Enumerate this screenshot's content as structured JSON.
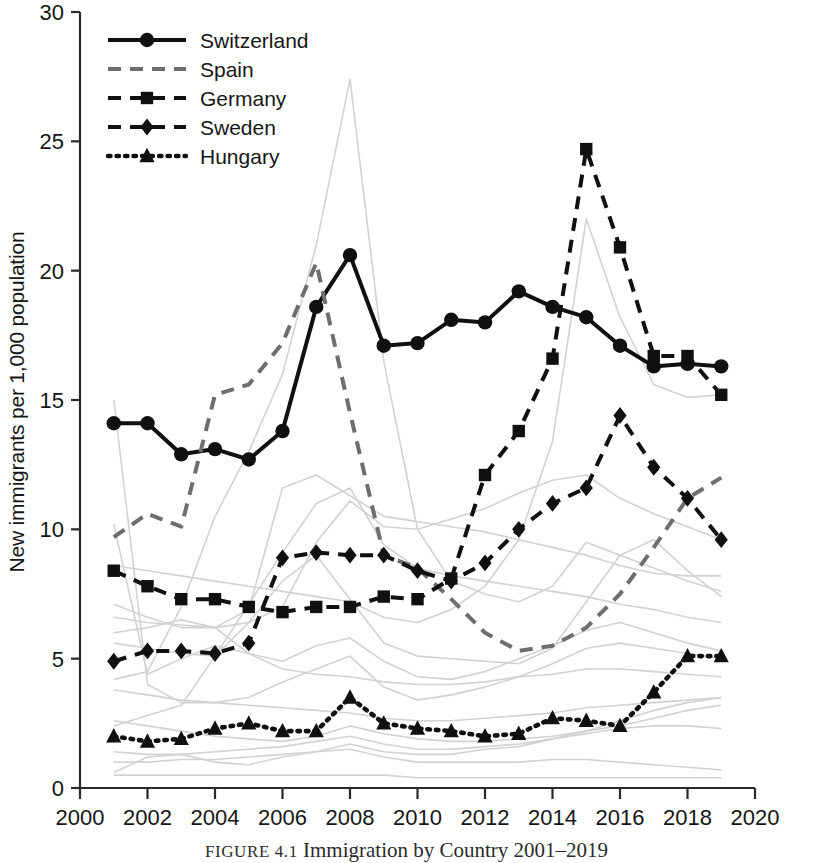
{
  "caption": {
    "figure_label": "FIGURE 4.1",
    "title": "Immigration by Country 2001–2019",
    "full": "FIGURE 4.1  Immigration by Country 2001–2019"
  },
  "chart_data": {
    "type": "line",
    "title": "",
    "xlabel": "",
    "ylabel": "New immigrants per 1,000 population",
    "xlim": [
      2000,
      2020
    ],
    "ylim": [
      0,
      30
    ],
    "xticks": [
      2000,
      2002,
      2004,
      2006,
      2008,
      2010,
      2012,
      2014,
      2016,
      2018,
      2020
    ],
    "yticks": [
      0,
      5,
      10,
      15,
      20,
      25,
      30
    ],
    "xtick_labels": [
      "2000",
      "2002",
      "2004",
      "2006",
      "2008",
      "2010",
      "2012",
      "2014",
      "2016",
      "2018",
      "2020"
    ],
    "ytick_labels": [
      "0",
      "5",
      "10",
      "15",
      "20",
      "25",
      "30"
    ],
    "grid": false,
    "legend_position": "upper-left-inside",
    "x": [
      2001,
      2002,
      2003,
      2004,
      2005,
      2006,
      2007,
      2008,
      2009,
      2010,
      2011,
      2012,
      2013,
      2014,
      2015,
      2016,
      2017,
      2018,
      2019
    ],
    "series": [
      {
        "name": "Switzerland",
        "color": "#101010",
        "line_style": "solid",
        "marker": "circle",
        "values": [
          14.1,
          14.1,
          12.9,
          13.1,
          12.7,
          13.8,
          18.6,
          20.6,
          17.1,
          17.2,
          18.1,
          18.0,
          19.2,
          18.6,
          18.2,
          17.1,
          16.3,
          16.4,
          16.3
        ]
      },
      {
        "name": "Spain",
        "color": "#6e6e6e",
        "line_style": "dashed",
        "marker": "none",
        "values": [
          9.7,
          10.6,
          10.1,
          15.2,
          15.6,
          17.2,
          20.3,
          14.5,
          9.0,
          8.5,
          7.3,
          6.0,
          5.3,
          5.5,
          6.2,
          7.5,
          9.3,
          11.2,
          12.0
        ]
      },
      {
        "name": "Germany",
        "color": "#101010",
        "line_style": "dashed",
        "marker": "square",
        "values": [
          8.4,
          7.8,
          7.3,
          7.3,
          7.0,
          6.8,
          7.0,
          7.0,
          7.4,
          7.3,
          8.1,
          12.1,
          13.8,
          16.6,
          24.7,
          20.9,
          16.7,
          16.7,
          15.2
        ]
      },
      {
        "name": "Sweden",
        "color": "#101010",
        "line_style": "dashed",
        "marker": "diamond",
        "values": [
          4.9,
          5.3,
          5.3,
          5.2,
          5.6,
          8.9,
          9.1,
          9.0,
          9.0,
          8.4,
          8.0,
          8.7,
          10.0,
          11.0,
          11.6,
          14.4,
          12.4,
          11.2,
          9.6
        ]
      },
      {
        "name": "Hungary",
        "color": "#101010",
        "line_style": "dotted",
        "marker": "triangle",
        "values": [
          2.0,
          1.8,
          1.9,
          2.3,
          2.5,
          2.2,
          2.2,
          3.5,
          2.5,
          2.3,
          2.2,
          2.0,
          2.1,
          2.7,
          2.6,
          2.4,
          3.7,
          5.1,
          5.1
        ]
      }
    ],
    "background_series_note": "many light-gray unlabeled country lines",
    "background_series": [
      {
        "name": "bg-1",
        "values": [
          15.0,
          4.0,
          3.3,
          3.3,
          3.5,
          4.1,
          4.6,
          5.1,
          3.9,
          3.4,
          3.6,
          3.9,
          4.3,
          4.8,
          5.4,
          5.6,
          5.4,
          5.2,
          5.0
        ]
      },
      {
        "name": "bg-2",
        "values": [
          0.6,
          1.2,
          1.3,
          1.0,
          0.9,
          1.2,
          1.4,
          1.7,
          1.4,
          1.3,
          1.3,
          1.5,
          1.6,
          1.9,
          2.2,
          2.6,
          3.0,
          3.3,
          3.5
        ]
      },
      {
        "name": "bg-3",
        "values": [
          6.6,
          6.4,
          6.3,
          6.2,
          6.4,
          7.0,
          9.5,
          11.1,
          10.1,
          10.0,
          10.4,
          10.8,
          11.4,
          11.9,
          12.1,
          11.2,
          10.6,
          10.1,
          9.6
        ]
      },
      {
        "name": "bg-4",
        "values": [
          7.1,
          6.6,
          6.2,
          6.2,
          6.9,
          11.6,
          12.1,
          11.3,
          10.5,
          10.3,
          10.1,
          9.9,
          9.6,
          9.3,
          9.0,
          8.6,
          8.3,
          8.2,
          8.2
        ]
      },
      {
        "name": "bg-5",
        "values": [
          2.4,
          2.8,
          3.2,
          5.1,
          7.1,
          9.1,
          11.0,
          11.6,
          9.4,
          8.5,
          8.2,
          8.0,
          7.8,
          7.6,
          7.4,
          7.1,
          6.9,
          6.6,
          6.4
        ]
      },
      {
        "name": "bg-6",
        "values": [
          10.2,
          4.4,
          5.0,
          5.5,
          5.2,
          4.9,
          5.5,
          5.8,
          4.9,
          4.3,
          4.2,
          4.5,
          5.0,
          5.5,
          6.1,
          6.4,
          6.0,
          5.6,
          5.3
        ]
      },
      {
        "name": "bg-7",
        "values": [
          1.0,
          1.0,
          1.1,
          1.1,
          1.2,
          1.3,
          1.4,
          1.5,
          1.2,
          1.0,
          1.0,
          1.0,
          1.0,
          1.1,
          1.1,
          1.0,
          0.9,
          0.8,
          0.7
        ]
      },
      {
        "name": "bg-8",
        "values": [
          4.2,
          4.5,
          7.0,
          10.5,
          13.0,
          16.0,
          21.0,
          27.4,
          16.5,
          10.0,
          8.0,
          7.5,
          7.2,
          7.8,
          9.5,
          9.0,
          8.5,
          8.0,
          7.6
        ]
      },
      {
        "name": "bg-9",
        "values": [
          8.6,
          8.4,
          8.2,
          8.0,
          7.8,
          7.6,
          7.4,
          7.2,
          6.6,
          6.4,
          6.9,
          7.8,
          9.6,
          13.4,
          22.0,
          18.2,
          15.6,
          15.1,
          15.2
        ]
      },
      {
        "name": "bg-10",
        "values": [
          3.8,
          3.6,
          3.4,
          3.3,
          3.2,
          3.1,
          3.0,
          2.9,
          2.7,
          2.6,
          2.6,
          2.7,
          2.8,
          2.9,
          3.1,
          3.2,
          3.3,
          3.4,
          3.5
        ]
      },
      {
        "name": "bg-11",
        "values": [
          0.5,
          0.5,
          0.5,
          0.5,
          0.5,
          0.5,
          0.5,
          0.5,
          0.5,
          0.4,
          0.4,
          0.4,
          0.4,
          0.4,
          0.4,
          0.4,
          0.4,
          0.4,
          0.4
        ]
      },
      {
        "name": "bg-12",
        "values": [
          5.6,
          5.4,
          5.2,
          5.1,
          6.4,
          8.0,
          9.0,
          7.3,
          5.6,
          5.1,
          5.0,
          4.9,
          4.8,
          5.4,
          7.2,
          9.0,
          9.6,
          8.4,
          7.4
        ]
      },
      {
        "name": "bg-13",
        "values": [
          1.4,
          1.3,
          1.3,
          1.4,
          1.5,
          1.6,
          1.8,
          2.0,
          1.7,
          1.5,
          1.5,
          1.6,
          1.7,
          1.9,
          2.1,
          2.3,
          2.4,
          2.4,
          2.3
        ]
      },
      {
        "name": "bg-14",
        "values": [
          6.0,
          6.2,
          6.5,
          6.2,
          5.2,
          4.6,
          4.4,
          4.3,
          4.1,
          4.0,
          4.0,
          4.1,
          4.3,
          4.4,
          4.6,
          4.6,
          4.5,
          4.4,
          4.3
        ]
      },
      {
        "name": "bg-15",
        "values": [
          2.6,
          2.4,
          2.2,
          2.0,
          1.9,
          1.8,
          2.0,
          2.4,
          2.1,
          1.9,
          1.8,
          1.8,
          1.9,
          2.0,
          2.2,
          2.4,
          2.7,
          3.0,
          3.2
        ]
      }
    ]
  },
  "legend": {
    "entries": [
      {
        "label": "Switzerland",
        "style": "solid-circle"
      },
      {
        "label": "Spain",
        "style": "gray-dashed"
      },
      {
        "label": "Germany",
        "style": "dashed-square"
      },
      {
        "label": "Sweden",
        "style": "dashed-diamond"
      },
      {
        "label": "Hungary",
        "style": "dotted-triangle"
      }
    ]
  },
  "axes": {
    "y_title": "New immigrants per 1,000 population"
  }
}
